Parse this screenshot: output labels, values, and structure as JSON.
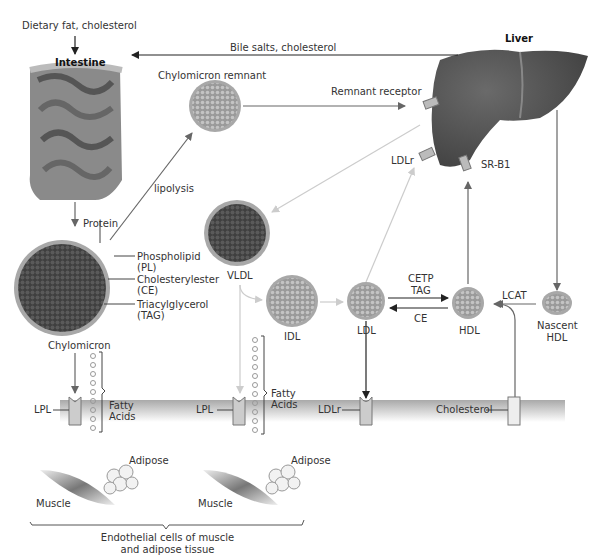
{
  "labels": {
    "dietary_input": "Dietary fat, cholesterol",
    "intestine": "Intestine",
    "liver": "Liver",
    "bile": "Bile salts, cholesterol",
    "chylomicron_remnant": "Chylomicron remnant",
    "remnant_receptor": "Remnant receptor",
    "lipolysis": "lipolysis",
    "protein": "Protein",
    "phospholipid": "Phospholipid",
    "phospholipid_abbr": "(PL)",
    "cholesterylester": "Cholesterylester",
    "cholesterylester_abbr": "(CE)",
    "triacylglycerol": "Triacylglycerol",
    "triacylglycerol_abbr": "(TAG)",
    "chylomicron": "Chylomicron",
    "vldl": "VLDL",
    "idl": "IDL",
    "ldl": "LDL",
    "hdl": "HDL",
    "nascent_hdl_1": "Nascent",
    "nascent_hdl_2": "HDL",
    "ldlr_liver": "LDLr",
    "srb1": "SR-B1",
    "cetp": "CETP",
    "tag": "TAG",
    "ce": "CE",
    "lcat": "LCAT",
    "fatty_acids_1a": "Fatty",
    "fatty_acids_1b": "Acids",
    "fatty_acids_2a": "Fatty",
    "fatty_acids_2b": "Acids",
    "lpl_1": "LPL",
    "lpl_2": "LPL",
    "ldlr_membrane": "LDLr",
    "cholesterol_membrane": "Cholesterol",
    "adipose_1": "Adipose",
    "adipose_2": "Adipose",
    "muscle_1": "Muscle",
    "muscle_2": "Muscle",
    "endothelial_1": "Endothelial cells of muscle",
    "endothelial_2": "and adipose tissue"
  },
  "colors": {
    "arrow_dark": "#222222",
    "arrow_gray": "#666666",
    "arrow_light": "#cccccc",
    "particle_shell": "#a8a8a8",
    "particle_core": "#4a4a4a",
    "liver": "#4f4f4f",
    "membrane": "#bdbdbd"
  }
}
